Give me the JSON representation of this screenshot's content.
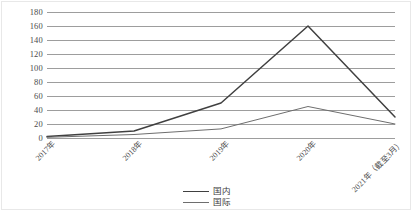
{
  "chart_data": {
    "type": "line",
    "title": "",
    "subtitle": "",
    "xlabel": "",
    "ylabel": "",
    "categories": [
      "2017年",
      "2018年",
      "2019年",
      "2020年",
      "2021年（截至3月）"
    ],
    "series": [
      {
        "name": "国内",
        "values": [
          2,
          10,
          50,
          160,
          30
        ],
        "color": "#404040"
      },
      {
        "name": "国际",
        "values": [
          1,
          5,
          13,
          45,
          20
        ],
        "color": "#6e6e6e"
      }
    ],
    "ylim": [
      0,
      180
    ],
    "yticks": [
      0,
      20,
      40,
      60,
      80,
      100,
      120,
      140,
      160,
      180
    ],
    "ytick_labels": [
      "0",
      "20",
      "40",
      "60",
      "80",
      "100",
      "120",
      "140",
      "160",
      "180"
    ],
    "grid": true,
    "grid_color": "#9d9d9d",
    "legend_position": "bottom",
    "legend": [
      "国内",
      "国际"
    ],
    "annotations": []
  }
}
